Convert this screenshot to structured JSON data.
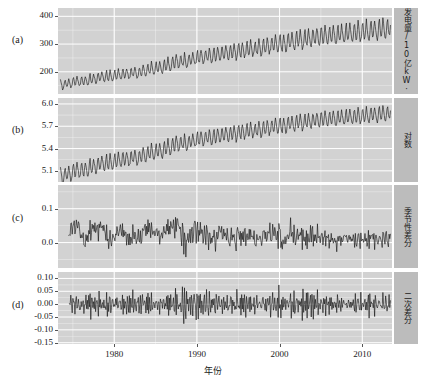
{
  "figure": {
    "xaxis_title": "年份",
    "panel_letters": [
      "(a)",
      "(b)",
      "(c)",
      "(d)"
    ],
    "xticks": [
      {
        "label": "1980",
        "value": 1980
      },
      {
        "label": "1990",
        "value": 1990
      },
      {
        "label": "2000",
        "value": 2000
      },
      {
        "label": "2010",
        "value": 2010
      }
    ],
    "xlim": [
      1973.2,
      2013.6
    ],
    "strip_labels": [
      "月发电量/10亿kW·h",
      "对数",
      "季节性差分",
      "二次差分"
    ],
    "colors": {
      "panel_background": "#d2d2d2",
      "strip_background": "#bcbcbc",
      "grid_major": "#ffffff",
      "line": "#101010",
      "text": "#1a1a1a",
      "page_background": "#ffffff"
    }
  },
  "chart_data": [
    {
      "type": "line",
      "title": "",
      "panel": "(a)",
      "ylabel": "月发电量/10亿kW·h",
      "xlabel": "年份",
      "xlim": [
        1973.2,
        2013.6
      ],
      "ylim": [
        120,
        430
      ],
      "yticks": [
        200,
        300,
        400
      ],
      "ytick_labels": [
        "200",
        "300",
        "400"
      ],
      "grid": true,
      "description": "Monthly electricity generation in billions of kWh, rising from about 150 in 1973 to about 360 by 2013, with strong annual seasonal oscillation whose amplitude grows with level.",
      "x_start": 1973.5,
      "x_step": 0.08333,
      "trend_anchors": [
        {
          "x": 1973.5,
          "y": 152
        },
        {
          "x": 1976.0,
          "y": 165
        },
        {
          "x": 1979.0,
          "y": 182
        },
        {
          "x": 1982.0,
          "y": 192
        },
        {
          "x": 1985.0,
          "y": 210
        },
        {
          "x": 1988.0,
          "y": 235
        },
        {
          "x": 1991.0,
          "y": 252
        },
        {
          "x": 1994.0,
          "y": 268
        },
        {
          "x": 1997.0,
          "y": 282
        },
        {
          "x": 2000.0,
          "y": 298
        },
        {
          "x": 2003.0,
          "y": 315
        },
        {
          "x": 2006.0,
          "y": 330
        },
        {
          "x": 2009.0,
          "y": 338
        },
        {
          "x": 2012.0,
          "y": 348
        },
        {
          "x": 2013.5,
          "y": 350
        }
      ],
      "seasonal_rel": [
        0.1,
        0.02,
        -0.03,
        -0.07,
        -0.05,
        -0.02,
        0.06,
        0.07,
        -0.01,
        -0.04,
        -0.02,
        0.06
      ],
      "amplitude_scale": 1.0
    },
    {
      "type": "line",
      "panel": "(b)",
      "ylabel": "对数",
      "xlabel": "年份",
      "xlim": [
        1973.2,
        2013.6
      ],
      "ylim": [
        4.95,
        6.08
      ],
      "yticks": [
        5.1,
        5.4,
        5.7,
        6.0
      ],
      "ytick_labels": [
        "5.1",
        "5.4",
        "5.7",
        "6.0"
      ],
      "grid": true,
      "description": "Natural logarithm of the series in panel (a): concave increasing from about 5.05 to about 5.85, with a constant-amplitude seasonal cycle."
    },
    {
      "type": "line",
      "panel": "(c)",
      "ylabel": "季节性差分",
      "xlabel": "年份",
      "xlim": [
        1973.2,
        2013.6
      ],
      "ylim": [
        -0.075,
        0.17
      ],
      "yticks": [
        0.0,
        0.1
      ],
      "ytick_labels": [
        "0.0",
        "0.1"
      ],
      "grid": true,
      "description": "Seasonal (lag-12) difference of the log series; fluctuates around roughly 0.03 early on, drifting toward 0.0 after 1995, range about -0.07 to 0.16."
    },
    {
      "type": "line",
      "panel": "(d)",
      "ylabel": "二次差分",
      "xlabel": "年份",
      "xlim": [
        1973.2,
        2013.6
      ],
      "ylim": [
        -0.155,
        0.125
      ],
      "yticks": [
        -0.15,
        -0.1,
        -0.05,
        0.0,
        0.05,
        0.1
      ],
      "ytick_labels": [
        "-0.15",
        "-0.10",
        "-0.05",
        "0.00",
        "0.05",
        "0.10"
      ],
      "grid": true,
      "description": "Second (regular plus seasonal) difference; stationary white-noise-like residual centred on 0.00 with occasional spikes to about +0.12 and -0.14."
    }
  ]
}
